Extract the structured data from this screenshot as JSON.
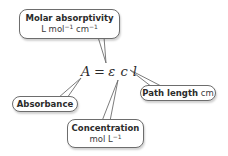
{
  "equation": {
    "lhs": "A",
    "operator": "=",
    "epsilon": "ε",
    "c": "c",
    "l": "l"
  },
  "callouts": {
    "molar_absorptivity": {
      "title": "Molar absorptivity",
      "unit_a": "L mol",
      "unit_a_exp": "−1",
      "unit_b": " cm",
      "unit_b_exp": "−1"
    },
    "path_length": {
      "title": "Path length",
      "unit": " cm"
    },
    "absorbance": {
      "title": "Absorbance"
    },
    "concentration": {
      "title": "Concentration",
      "unit": "mol L",
      "unit_exp": "−1"
    }
  },
  "colors": {
    "border": "#6d6d6d",
    "text": "#2a2a2a",
    "background": "#ffffff"
  }
}
